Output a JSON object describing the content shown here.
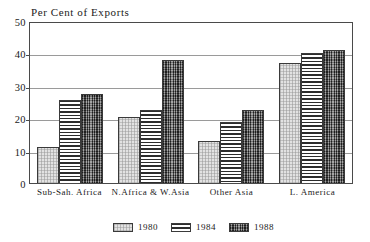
{
  "chart_data": {
    "type": "bar",
    "title": "Per Cent of Exports",
    "xlabel": "",
    "ylabel": "",
    "ylim": [
      0,
      50
    ],
    "yticks": [
      0,
      10,
      20,
      30,
      40,
      50
    ],
    "ytick_labels": [
      "0",
      "10",
      "20",
      "30",
      "40",
      "50"
    ],
    "grid": true,
    "legend_position": "bottom-center",
    "categories": [
      "Sub-Sah. Africa",
      "N.Africa & W.Asia",
      "Other Asia",
      "L. America"
    ],
    "series": [
      {
        "name": "1980",
        "values": [
          11.0,
          20.5,
          13.0,
          37.0
        ],
        "pattern": "light-stipple"
      },
      {
        "name": "1984",
        "values": [
          25.5,
          22.5,
          18.8,
          40.0
        ],
        "pattern": "horizontal-lines"
      },
      {
        "name": "1988",
        "values": [
          27.5,
          38.0,
          22.5,
          41.0
        ],
        "pattern": "dark-stipple"
      }
    ]
  },
  "legend": {
    "entries": [
      {
        "label": "1980",
        "swatch": "legend-swatch-1980"
      },
      {
        "label": "1984",
        "swatch": "legend-swatch-1984"
      },
      {
        "label": "1988",
        "swatch": "legend-swatch-1988"
      }
    ]
  }
}
